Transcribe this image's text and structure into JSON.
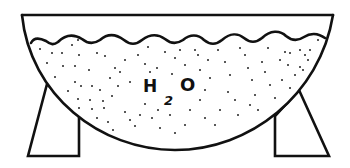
{
  "diagram": {
    "label": {
      "element": "H",
      "subscript": "2",
      "element2": "O",
      "full": "H2O"
    },
    "colors": {
      "line": "#111111",
      "background": "#ffffff",
      "dots": "#222222"
    },
    "parts": [
      "bowl-rim",
      "bowl-body",
      "water-surface",
      "water-dots",
      "left-leg",
      "right-leg",
      "chemical-label"
    ]
  }
}
